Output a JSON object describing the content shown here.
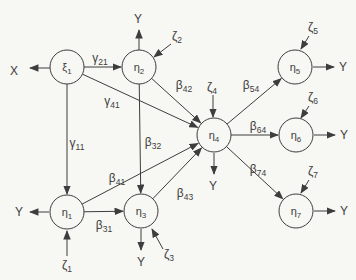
{
  "figure": {
    "type": "sem-path-diagram",
    "canvas": {
      "width": 356,
      "height": 280
    },
    "colors": {
      "background": "#f7f7f4",
      "ink": "#3d3d3d",
      "node_fill": "none"
    },
    "nodes": [
      {
        "id": "xi1",
        "base": "ξ",
        "sub": "1",
        "x": 67,
        "y": 67,
        "r": 17
      },
      {
        "id": "eta2",
        "base": "η",
        "sub": "2",
        "x": 139,
        "y": 67,
        "r": 17
      },
      {
        "id": "eta5",
        "base": "η",
        "sub": "5",
        "x": 295,
        "y": 67,
        "r": 17
      },
      {
        "id": "eta4",
        "base": "η",
        "sub": "4",
        "x": 214,
        "y": 135,
        "r": 17
      },
      {
        "id": "eta6",
        "base": "η",
        "sub": "6",
        "x": 296,
        "y": 135,
        "r": 17
      },
      {
        "id": "eta1",
        "base": "η",
        "sub": "1",
        "x": 67,
        "y": 212,
        "r": 17
      },
      {
        "id": "eta3",
        "base": "η",
        "sub": "3",
        "x": 141,
        "y": 211,
        "r": 17
      },
      {
        "id": "eta7",
        "base": "η",
        "sub": "7",
        "x": 296,
        "y": 211,
        "r": 17
      }
    ],
    "paths": [
      {
        "id": "gamma21",
        "from": "xi1",
        "to": "eta2",
        "base": "γ",
        "sub": "21",
        "lx": 100,
        "ly": 62
      },
      {
        "id": "gamma11",
        "from": "xi1",
        "to": "eta1",
        "base": "γ",
        "sub": "11",
        "lx": 77,
        "ly": 147
      },
      {
        "id": "gamma41",
        "from": "xi1",
        "to": "eta4",
        "base": "γ",
        "sub": "41",
        "lx": 112,
        "ly": 105
      },
      {
        "id": "beta42",
        "from": "eta2",
        "to": "eta4",
        "base": "β",
        "sub": "42",
        "lx": 184,
        "ly": 89
      },
      {
        "id": "beta32",
        "from": "eta2",
        "to": "eta3",
        "base": "β",
        "sub": "32",
        "lx": 153,
        "ly": 146
      },
      {
        "id": "beta31",
        "from": "eta1",
        "to": "eta3",
        "base": "β",
        "sub": "31",
        "lx": 104,
        "ly": 229
      },
      {
        "id": "beta41",
        "from": "eta1",
        "to": "eta4",
        "base": "β",
        "sub": "41",
        "lx": 117,
        "ly": 182
      },
      {
        "id": "beta43",
        "from": "eta3",
        "to": "eta4",
        "base": "β",
        "sub": "43",
        "lx": 185,
        "ly": 197
      },
      {
        "id": "beta54",
        "from": "eta4",
        "to": "eta5",
        "base": "β",
        "sub": "54",
        "lx": 251,
        "ly": 89
      },
      {
        "id": "beta64",
        "from": "eta4",
        "to": "eta6",
        "base": "β",
        "sub": "64",
        "lx": 258,
        "ly": 130
      },
      {
        "id": "beta74",
        "from": "eta4",
        "to": "eta7",
        "base": "β",
        "sub": "74",
        "lx": 258,
        "ly": 173
      }
    ],
    "externals": [
      {
        "id": "x-xi1",
        "base": "X",
        "sub": "",
        "lx": 14,
        "ly": 75,
        "x1": 50,
        "y1": 68,
        "x2": 30,
        "y2": 68
      },
      {
        "id": "y-eta2",
        "base": "Y",
        "sub": "",
        "lx": 138,
        "ly": 23,
        "x1": 139,
        "y1": 50,
        "x2": 139,
        "y2": 30
      },
      {
        "id": "zeta2",
        "base": "ζ",
        "sub": "2",
        "lx": 177,
        "ly": 40,
        "x1": 171,
        "y1": 44,
        "x2": 154,
        "y2": 57
      },
      {
        "id": "zeta4",
        "base": "ζ",
        "sub": "4",
        "lx": 212,
        "ly": 91,
        "x1": 213,
        "y1": 95,
        "x2": 213,
        "y2": 117
      },
      {
        "id": "zeta5",
        "base": "ζ",
        "sub": "5",
        "lx": 313,
        "ly": 31,
        "x1": 309,
        "y1": 36,
        "x2": 301,
        "y2": 49
      },
      {
        "id": "y-eta5",
        "base": "Y",
        "sub": "",
        "lx": 343,
        "ly": 71,
        "x1": 313,
        "y1": 67,
        "x2": 334,
        "y2": 67
      },
      {
        "id": "zeta6",
        "base": "ζ",
        "sub": "6",
        "lx": 313,
        "ly": 101,
        "x1": 309,
        "y1": 106,
        "x2": 301,
        "y2": 118
      },
      {
        "id": "y-eta6",
        "base": "Y",
        "sub": "",
        "lx": 344,
        "ly": 139,
        "x1": 314,
        "y1": 135,
        "x2": 335,
        "y2": 135
      },
      {
        "id": "zeta7",
        "base": "ζ",
        "sub": "7",
        "lx": 313,
        "ly": 175,
        "x1": 309,
        "y1": 180,
        "x2": 301,
        "y2": 193
      },
      {
        "id": "y-eta7",
        "base": "Y",
        "sub": "",
        "lx": 344,
        "ly": 215,
        "x1": 314,
        "y1": 211,
        "x2": 335,
        "y2": 211
      },
      {
        "id": "y-eta4",
        "base": "Y",
        "sub": "",
        "lx": 213,
        "ly": 190,
        "x1": 214,
        "y1": 153,
        "x2": 214,
        "y2": 174
      },
      {
        "id": "y-eta1",
        "base": "Y",
        "sub": "",
        "lx": 19,
        "ly": 216,
        "x1": 49,
        "y1": 212,
        "x2": 30,
        "y2": 212
      },
      {
        "id": "zeta1",
        "base": "ζ",
        "sub": "1",
        "lx": 67,
        "ly": 269,
        "x1": 67,
        "y1": 256,
        "x2": 67,
        "y2": 231
      },
      {
        "id": "y-eta3",
        "base": "Y",
        "sub": "",
        "lx": 141,
        "ly": 266,
        "x1": 141,
        "y1": 229,
        "x2": 141,
        "y2": 250
      },
      {
        "id": "zeta3",
        "base": "ζ",
        "sub": "3",
        "lx": 169,
        "ly": 258,
        "x1": 163,
        "y1": 249,
        "x2": 152,
        "y2": 229
      }
    ]
  }
}
